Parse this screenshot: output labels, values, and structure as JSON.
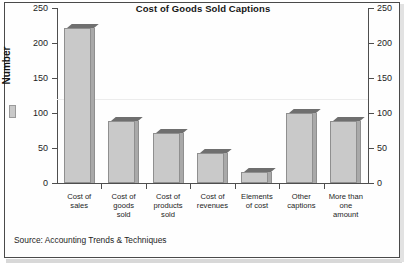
{
  "figure": {
    "title": "Cost of Goods Sold Captions",
    "source_note": "Source: Accounting Trends & Techniques",
    "y_axis_title": "Number"
  },
  "chart_data": {
    "type": "bar",
    "title": "Cost of Goods Sold Captions",
    "xlabel": "",
    "ylabel": "Number",
    "ylim": [
      0,
      250
    ],
    "yticks": [
      0,
      50,
      100,
      150,
      200,
      250
    ],
    "ytick_labels": [
      "0",
      "50",
      "100",
      "150",
      "200",
      "250"
    ],
    "right_axis": true,
    "right_ytick_labels": [
      "0",
      "50",
      "100",
      "150",
      "200",
      "250"
    ],
    "grid": false,
    "legend": [
      "Number"
    ],
    "legend_position": "left",
    "categories": [
      "Cost of\nsales",
      "Cost of\ngoods\nsold",
      "Cost of\nproducts\nsold",
      "Cost of\nrevenues",
      "Elements\nof cost",
      "Other\ncaptions",
      "More than\none\namount"
    ],
    "values": [
      221,
      89,
      71,
      43,
      16,
      100,
      88
    ],
    "bar_color": "#c9c9c9",
    "bar_edge_color": "#8f8f8f",
    "source": "Source: Accounting Trends & Techniques"
  }
}
